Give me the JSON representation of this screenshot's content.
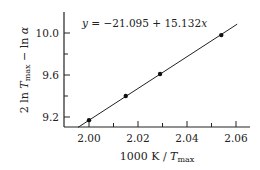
{
  "chart_data": {
    "type": "scatter",
    "title": "",
    "xlabel": "1000 K / T_max",
    "ylabel": "2 ln T_max − ln α",
    "xlim": [
      1.99,
      2.066
    ],
    "ylim": [
      9.1,
      10.2
    ],
    "x_ticks": [
      "2.00",
      "2.02",
      "2.04",
      "2.06"
    ],
    "y_ticks": [
      "9.2",
      "9.6",
      "10.0"
    ],
    "grid": false,
    "legend": null,
    "series": [
      {
        "name": "data",
        "x": [
          2.0,
          2.015,
          2.029,
          2.054
        ],
        "y": [
          9.17,
          9.4,
          9.61,
          9.98
        ]
      }
    ],
    "fit": {
      "equation": "y = −21.095 + 15.132x",
      "intercept": -21.095,
      "slope": 15.132
    },
    "annotations": [
      "y = −21.095 + 15.132x"
    ]
  },
  "labels": {
    "equation_prefix": "y",
    "equation_body": " = −21.095 + 15.132",
    "equation_var": "x",
    "xlabel_main": "1000 K / ",
    "xlabel_T": "T",
    "xlabel_sub": "max",
    "ylabel_a": "2 ln ",
    "ylabel_T": "T",
    "ylabel_sub": "max",
    "ylabel_b": " − ln ",
    "ylabel_alpha": "α",
    "xt0": "2.00",
    "xt1": "2.02",
    "xt2": "2.04",
    "xt3": "2.06",
    "yt0": "9.2",
    "yt1": "9.6",
    "yt2": "10.0"
  }
}
